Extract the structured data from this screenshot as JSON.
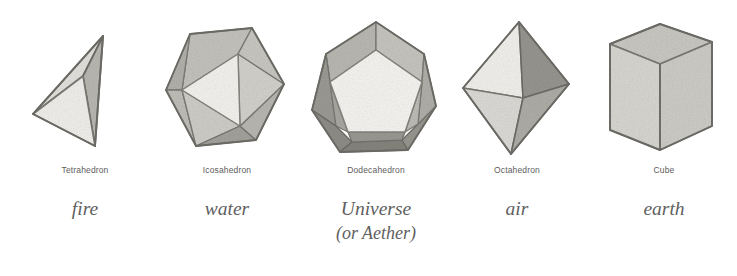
{
  "figure": {
    "background_color": "#ffffff",
    "caption_color": "#5c5c5c",
    "element_label_color": "#5f5f5f",
    "columns": [
      {
        "id": "tetrahedron",
        "solid_name": "Tetrahedron",
        "element": "fire",
        "element_line2": "",
        "faces": 4,
        "shape_kind": "tetrahedron"
      },
      {
        "id": "icosahedron",
        "solid_name": "Icosahedron",
        "element": "water",
        "element_line2": "",
        "faces": 20,
        "shape_kind": "icosahedron"
      },
      {
        "id": "dodecahedron",
        "solid_name": "Dodecahedron",
        "element": "Universe",
        "element_line2": "(or Aether)",
        "faces": 12,
        "shape_kind": "dodecahedron"
      },
      {
        "id": "octahedron",
        "solid_name": "Octahedron",
        "element": "air",
        "element_line2": "",
        "faces": 8,
        "shape_kind": "octahedron"
      },
      {
        "id": "cube",
        "solid_name": "Cube",
        "element": "earth",
        "element_line2": "",
        "faces": 6,
        "shape_kind": "cube"
      }
    ],
    "palette": {
      "face_brightest": "#f4f4f2",
      "face_bright": "#e9e9e6",
      "face_light": "#dddcd8",
      "face_mid": "#c9c8c3",
      "face_mid_dark": "#b4b3ad",
      "face_dark": "#9d9c96",
      "face_darkest": "#87867f",
      "edge": "#6e6d67",
      "edge_soft": "#8e8d87"
    }
  }
}
